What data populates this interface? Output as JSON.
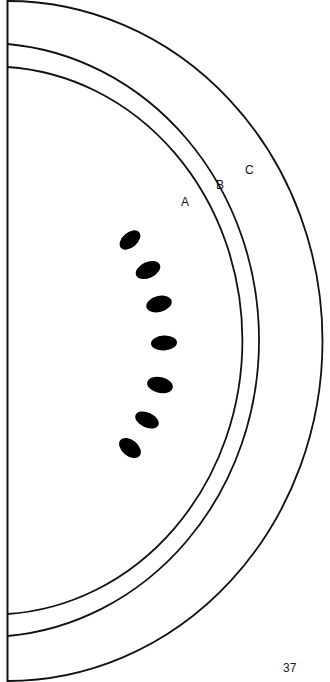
{
  "figure": {
    "rings": [
      {
        "label": "A",
        "name": "inner-fruit-boundary"
      },
      {
        "label": "B",
        "name": "middle-rind-ring"
      },
      {
        "label": "C",
        "name": "outer-rind-ring"
      }
    ],
    "seed_count": 7,
    "stroke_color": "#111111",
    "seed_color": "#000000",
    "background": "#ffffff"
  },
  "page_number": "37"
}
